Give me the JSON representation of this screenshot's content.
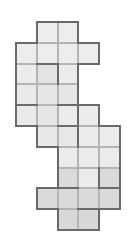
{
  "puzzle": {
    "origin_x": 16,
    "origin_y": 22,
    "cell_size": 20.8,
    "thin_color": "#b4b4b4",
    "thick_color": "#6a6a6a",
    "thin_width": 1,
    "thick_width": 2,
    "cells": [
      {
        "r": 0,
        "c": 1,
        "fill": "#ededed"
      },
      {
        "r": 0,
        "c": 2,
        "fill": "#ededed"
      },
      {
        "r": 1,
        "c": 0,
        "fill": "#ededed"
      },
      {
        "r": 1,
        "c": 1,
        "fill": "#ededed"
      },
      {
        "r": 1,
        "c": 2,
        "fill": "#ededed"
      },
      {
        "r": 1,
        "c": 3,
        "fill": "#ededed"
      },
      {
        "r": 2,
        "c": 0,
        "fill": "#ececec"
      },
      {
        "r": 2,
        "c": 1,
        "fill": "#e3e3e3"
      },
      {
        "r": 2,
        "c": 2,
        "fill": "#ececec"
      },
      {
        "r": 3,
        "c": 0,
        "fill": "#e9e9e9"
      },
      {
        "r": 3,
        "c": 1,
        "fill": "#e6e6e6"
      },
      {
        "r": 3,
        "c": 2,
        "fill": "#e6e6e6"
      },
      {
        "r": 4,
        "c": 0,
        "fill": "#e9e9e9"
      },
      {
        "r": 4,
        "c": 1,
        "fill": "#e6e6e6"
      },
      {
        "r": 4,
        "c": 2,
        "fill": "#ececec"
      },
      {
        "r": 4,
        "c": 3,
        "fill": "#ececec"
      },
      {
        "r": 5,
        "c": 1,
        "fill": "#e8e8e8"
      },
      {
        "r": 5,
        "c": 2,
        "fill": "#e8e8e8"
      },
      {
        "r": 5,
        "c": 3,
        "fill": "#ececec"
      },
      {
        "r": 5,
        "c": 4,
        "fill": "#ececec"
      },
      {
        "r": 6,
        "c": 2,
        "fill": "#ebebeb"
      },
      {
        "r": 6,
        "c": 3,
        "fill": "#ebebeb"
      },
      {
        "r": 6,
        "c": 4,
        "fill": "#ebebeb"
      },
      {
        "r": 7,
        "c": 2,
        "fill": "#dadada"
      },
      {
        "r": 7,
        "c": 3,
        "fill": "#ececec"
      },
      {
        "r": 7,
        "c": 4,
        "fill": "#dadada"
      },
      {
        "r": 8,
        "c": 1,
        "fill": "#dadada"
      },
      {
        "r": 8,
        "c": 2,
        "fill": "#dadada"
      },
      {
        "r": 8,
        "c": 3,
        "fill": "#dadada"
      },
      {
        "r": 8,
        "c": 4,
        "fill": "#dadada"
      },
      {
        "r": 9,
        "c": 2,
        "fill": "#d8d8d8"
      },
      {
        "r": 9,
        "c": 3,
        "fill": "#d8d8d8"
      }
    ],
    "thick_internal_edges": [
      {
        "type": "h",
        "r": 1,
        "c": 1
      },
      {
        "type": "v",
        "r": 2,
        "c": 1
      },
      {
        "type": "v",
        "r": 2,
        "c": 2
      },
      {
        "type": "h",
        "r": 3,
        "c": 0
      },
      {
        "type": "h",
        "r": 3,
        "c": 2
      },
      {
        "type": "h",
        "r": 4,
        "c": 2
      },
      {
        "type": "v",
        "r": 4,
        "c": 2
      },
      {
        "type": "v",
        "r": 5,
        "c": 2
      },
      {
        "type": "h",
        "r": 5,
        "c": 1
      },
      {
        "type": "h",
        "r": 7,
        "c": 2
      },
      {
        "type": "h",
        "r": 7,
        "c": 4
      },
      {
        "type": "v",
        "r": 7,
        "c": 3
      },
      {
        "type": "v",
        "r": 7,
        "c": 4
      },
      {
        "type": "h",
        "r": 8,
        "c": 3
      }
    ]
  }
}
